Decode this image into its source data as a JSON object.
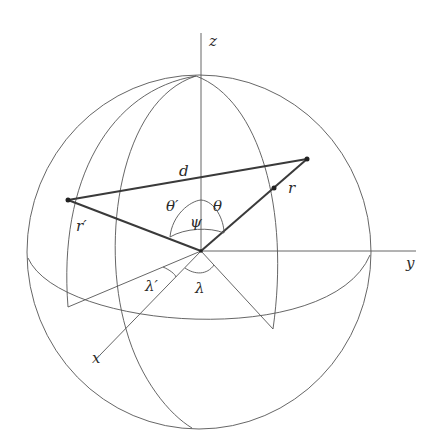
{
  "diagram": {
    "type": "spherical-geometry",
    "axes": {
      "z": "z",
      "y": "y",
      "x": "x"
    },
    "labels": {
      "d": "d",
      "r": "r",
      "r_prime": "r′",
      "theta": "θ",
      "theta_prime": "θ′",
      "psi": "ψ",
      "lambda": "λ",
      "lambda_prime": "λ′"
    },
    "colors": {
      "line": "#555555",
      "vector": "#3a3a3a",
      "background": "#ffffff"
    }
  }
}
